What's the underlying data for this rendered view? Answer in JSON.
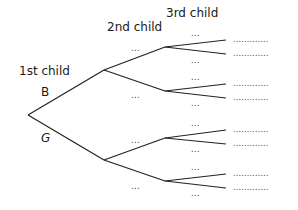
{
  "diagram": {
    "type": "probability-tree",
    "headers": {
      "first": "1st child",
      "second": "2nd child",
      "third": "3rd child"
    },
    "level1": [
      {
        "label": "B"
      },
      {
        "label": "G"
      }
    ],
    "level2_placeholder": "...",
    "level3_placeholder": "...",
    "outcome_placeholder": ".............",
    "colors": {
      "line": "#222222",
      "text": "#1a1a1a"
    }
  }
}
